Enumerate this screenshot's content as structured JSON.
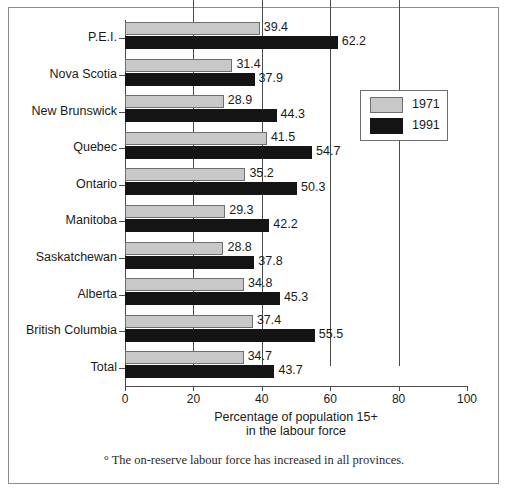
{
  "chart_data": {
    "type": "bar",
    "orientation": "horizontal",
    "title": "",
    "xlabel": "Percentage of population 15+ in the labour force",
    "ylabel": "",
    "xlim": [
      0,
      100
    ],
    "xticks": [
      0,
      20,
      40,
      60,
      80,
      100
    ],
    "grid": "vertical gridlines at 20, 40, 60, 80",
    "legend_position": "upper right inside plot",
    "categories": [
      "P.E.I.",
      "Nova Scotia",
      "New Brunswick",
      "Quebec",
      "Ontario",
      "Manitoba",
      "Saskatchewan",
      "Alberta",
      "British Columbia",
      "Total"
    ],
    "series": [
      {
        "name": "1971",
        "color": "#c8c8c8",
        "values": [
          39.4,
          31.4,
          28.9,
          41.5,
          35.2,
          29.3,
          28.8,
          34.8,
          37.4,
          34.7
        ]
      },
      {
        "name": "1991",
        "color": "#141414",
        "values": [
          62.2,
          37.9,
          44.3,
          54.7,
          50.3,
          42.2,
          37.8,
          45.3,
          55.5,
          43.7
        ]
      }
    ],
    "footnote": "° The on-reserve labour force has increased in all provinces."
  },
  "axis": {
    "title_line1": "Percentage of population 15+",
    "title_line2": "in the labour force",
    "tick_labels": [
      "0",
      "20",
      "40",
      "60",
      "80",
      "100"
    ]
  },
  "legend": {
    "entries": [
      {
        "label": "1971",
        "swatch": "gray-swatch"
      },
      {
        "label": "1991",
        "swatch": "black-swatch"
      }
    ]
  },
  "footnote": {
    "text": "° The on-reserve labour force has increased in all provinces."
  },
  "colors": {
    "series_1971": "#c8c8c8",
    "series_1991": "#141414",
    "axis": "#4a4a4a",
    "frame": "#8d8d8d",
    "text": "#1a1a1a"
  }
}
